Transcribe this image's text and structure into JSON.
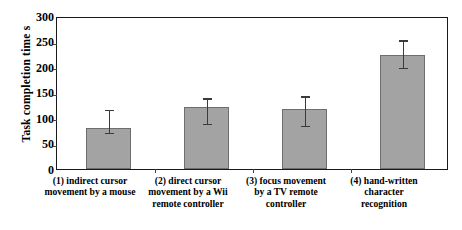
{
  "chart_data": {
    "type": "bar",
    "title": "",
    "xlabel": "",
    "ylabel": "Task completion time  s",
    "ylim": [
      0,
      300
    ],
    "yticks": [
      0,
      50,
      100,
      150,
      200,
      250,
      300
    ],
    "ytick_labels": [
      "0",
      "50",
      "100",
      "150",
      "200",
      "250",
      "300"
    ],
    "grid": false,
    "legend": "none",
    "categories": [
      "(1) indirect cursor movement by a mouse",
      "(2) direct cursor movement by a Wii remote controller",
      "(3) focus movement by a TV remote controller",
      "(4) hand-written character recognition"
    ],
    "category_lines": [
      [
        "(1) indirect cursor",
        "movement by a mouse"
      ],
      [
        "(2) direct cursor",
        "movement by a Wii",
        "remote controller"
      ],
      [
        "(3) focus movement",
        "by a TV remote",
        "controller"
      ],
      [
        "(4) hand-written",
        "character",
        "recognition"
      ]
    ],
    "values": [
      80,
      122,
      118,
      224
    ],
    "error_upper": [
      113,
      136,
      140,
      250
    ],
    "error_lower": [
      68,
      86,
      82,
      196
    ],
    "bar_color": "#a3a3a3",
    "bar_edge_color": "#6e6e6e",
    "error_color": "#3a3a3a",
    "axis_color": "#1a1a1a"
  }
}
